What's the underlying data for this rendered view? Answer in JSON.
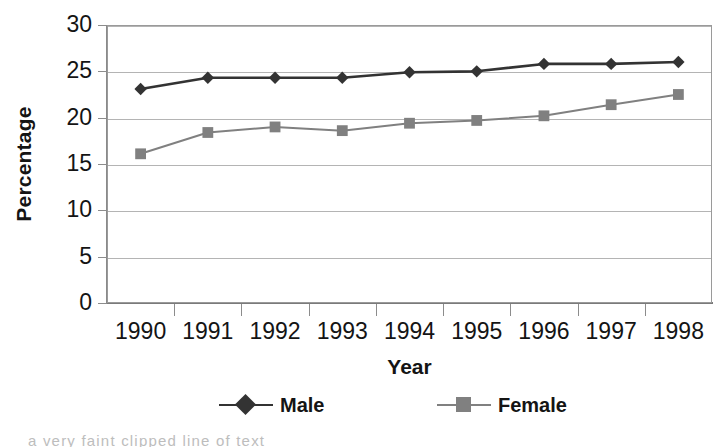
{
  "chart_data": {
    "type": "line",
    "title": "",
    "xlabel": "Year",
    "ylabel": "Percentage",
    "categories": [
      "1990",
      "1991",
      "1992",
      "1993",
      "1994",
      "1995",
      "1996",
      "1997",
      "1998"
    ],
    "series": [
      {
        "name": "Male",
        "marker": "diamond",
        "color": "#333333",
        "values": [
          23.1,
          24.3,
          24.3,
          24.3,
          24.9,
          25.0,
          25.8,
          25.8,
          26.0
        ]
      },
      {
        "name": "Female",
        "marker": "square",
        "color": "#808080",
        "values": [
          16.1,
          18.4,
          19.0,
          18.6,
          19.4,
          19.7,
          20.2,
          21.4,
          22.5
        ]
      }
    ],
    "ylim": [
      0,
      30
    ],
    "y_ticks": [
      "0",
      "5",
      "10",
      "15",
      "20",
      "25",
      "30"
    ],
    "y_tick_values": [
      0,
      5,
      10,
      15,
      20,
      25,
      30
    ],
    "grid": true,
    "grid_axis": "y",
    "legend_position": "bottom",
    "legend_entries": [
      "Male",
      "Female"
    ],
    "plot_border": true,
    "background_color": "#ffffff"
  },
  "caption": {
    "clipped_text": "a very faint clipped line of text"
  }
}
